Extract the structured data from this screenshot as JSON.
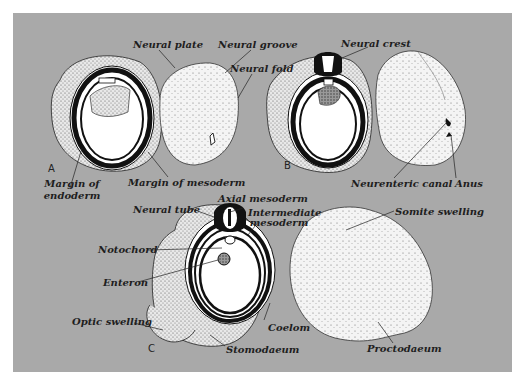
{
  "figure": {
    "background_color": "#a9a9a9",
    "panels": [
      {
        "id": "A",
        "letter": "A",
        "labels": {
          "neural_plate": "Neural plate",
          "neural_groove": "Neural groove",
          "neural_fold": "Neural fold",
          "margin_of_endoderm_1": "Margin of",
          "margin_of_endoderm_2": "endoderm",
          "margin_of_mesoderm": "Margin of mesoderm"
        }
      },
      {
        "id": "B",
        "letter": "B",
        "labels": {
          "neural_crest": "Neural crest",
          "neurenteric_canal": "Neurenteric canal",
          "anus": "Anus"
        }
      },
      {
        "id": "C",
        "letter": "C",
        "labels": {
          "axial_mesoderm": "Axial mesoderm",
          "neural_tube": "Neural tube",
          "intermediate_mesoderm_1": "Intermediate",
          "intermediate_mesoderm_2": "mesoderm",
          "notochord": "Notochord",
          "enteron": "Enteron",
          "optic_swelling": "Optic swelling",
          "stomodaeum": "Stomodaeum",
          "coelom": "Coelom",
          "somite_swelling": "Somite swelling",
          "proctodaeum": "Proctodaeum"
        }
      }
    ]
  }
}
